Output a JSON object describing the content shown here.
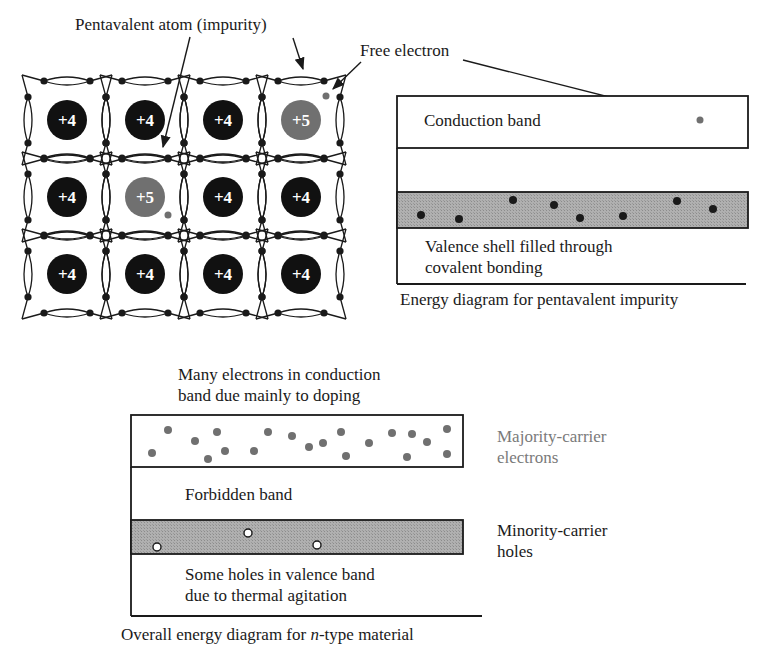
{
  "colors": {
    "ink": "#1a1a1a",
    "atom_si": "#111111",
    "atom_impurity": "#707070",
    "electron_gray": "#707070",
    "band_fill": "#a8a8a8",
    "majority_text": "#7a7a7a"
  },
  "lattice": {
    "title_label": "Pentavalent atom (impurity)",
    "free_electron_label": "Free electron",
    "rows": [
      [
        "+4",
        "+4",
        "+4",
        "+5"
      ],
      [
        "+4",
        "+5",
        "+4",
        "+4"
      ],
      [
        "+4",
        "+4",
        "+4",
        "+4"
      ]
    ]
  },
  "pentavalent_diagram": {
    "conduction_band_label": "Conduction band",
    "valence_label_line1": "Valence shell filled through",
    "valence_label_line2": "covalent bonding",
    "caption": "Energy diagram for pentavalent impurity",
    "valence_electrons": 8,
    "conduction_electrons": 1
  },
  "ntype_diagram": {
    "top_label_line1": "Many electrons in conduction",
    "top_label_line2": "band due mainly to doping",
    "forbidden_label": "Forbidden band",
    "bottom_label_line1": "Some holes in valence band",
    "bottom_label_line2": "due to thermal agitation",
    "majority_label_line1": "Majority-carrier",
    "majority_label_line2": "electrons",
    "minority_label_line1": "Minority-carrier",
    "minority_label_line2": "holes",
    "caption_prefix": "Overall energy diagram for ",
    "caption_italic": "n",
    "caption_suffix": "-type material",
    "conduction_electrons": 20,
    "valence_holes": 3
  }
}
